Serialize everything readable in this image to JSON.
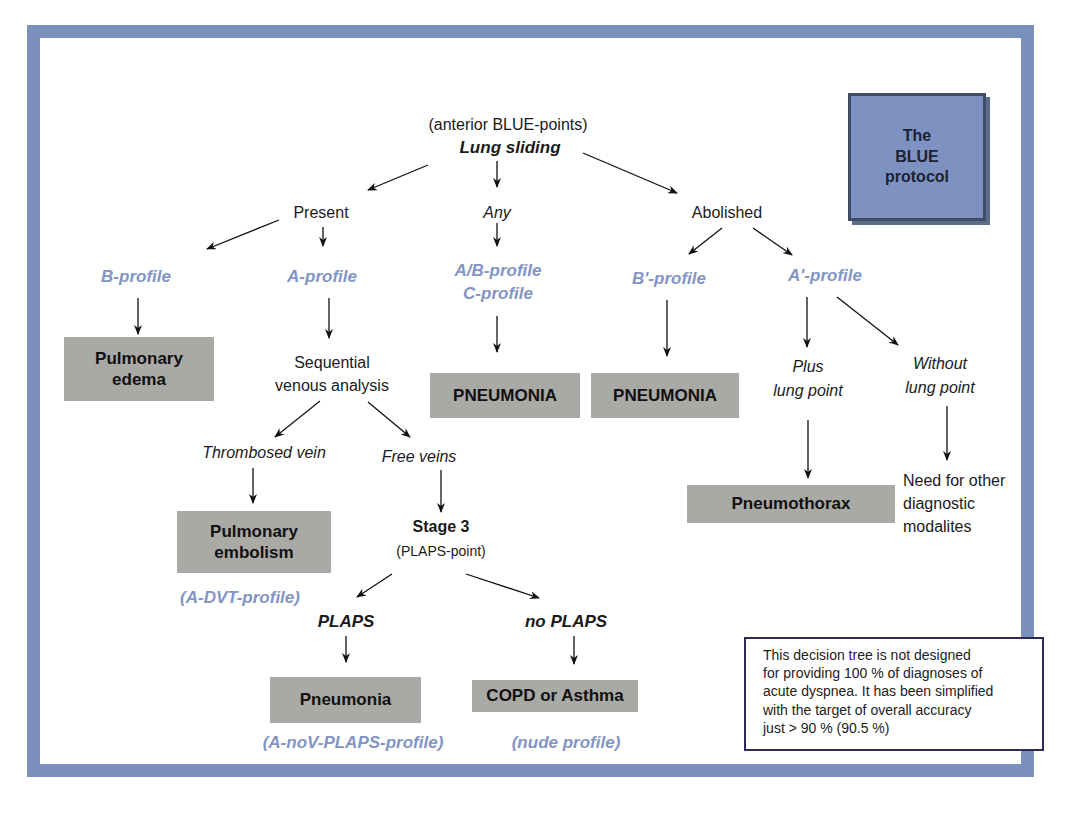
{
  "title_box": {
    "line1": "The",
    "line2": "BLUE",
    "line3": "protocol"
  },
  "root": {
    "subtitle": "(anterior BLUE-points)",
    "label": "Lung sliding"
  },
  "branches": {
    "present": "Present",
    "any": "Any",
    "abolished": "Abolished"
  },
  "profiles": {
    "b_profile": "B-profile",
    "a_profile": "A-profile",
    "ab_profile": "A/B-profile",
    "c_profile": "C-profile",
    "b_prime_profile": "B'-profile",
    "a_prime_profile": "A'-profile",
    "a_dvt_profile": "(A-DVT-profile)",
    "a_nov_plaps_profile": "(A-noV-PLAPS-profile)",
    "nude_profile": "(nude profile)"
  },
  "steps": {
    "sequential_line1": "Sequential",
    "sequential_line2": "venous analysis",
    "thrombosed_vein": "Thrombosed vein",
    "free_veins": "Free veins",
    "stage3": "Stage 3",
    "plaps_point": "(PLAPS-point)",
    "plaps": "PLAPS",
    "no_plaps": "no PLAPS",
    "plus_line1": "Plus",
    "plus_line2": "lung point",
    "without_line1": "Without",
    "without_line2": "lung point",
    "need_line1": "Need for other",
    "need_line2": "diagnostic",
    "need_line3": "modalites"
  },
  "diagnoses": {
    "pulmonary_edema_line1": "Pulmonary",
    "pulmonary_edema_line2": "edema",
    "pneumonia_c": "PNEUMONIA",
    "pneumonia_b_prime": "PNEUMONIA",
    "pneumothorax": "Pneumothorax",
    "pulmonary_embolism_line1": "Pulmonary",
    "pulmonary_embolism_line2": "embolism",
    "pneumonia_plaps": "Pneumonia",
    "copd_asthma": "COPD or Asthma"
  },
  "note": {
    "line1": "This decision tree is not designed",
    "line2": "for providing 100 % of diagnoses of",
    "line3": "acute dyspnea. It has been simplified",
    "line4": "with the target of overall accuracy",
    "line5": "just > 90 % (90.5 %)"
  },
  "colors": {
    "frame": "#7b8fbd",
    "profile_text": "#8395c4",
    "diagnosis_box": "#a9a9a6",
    "title_box": "#7e92c2"
  }
}
